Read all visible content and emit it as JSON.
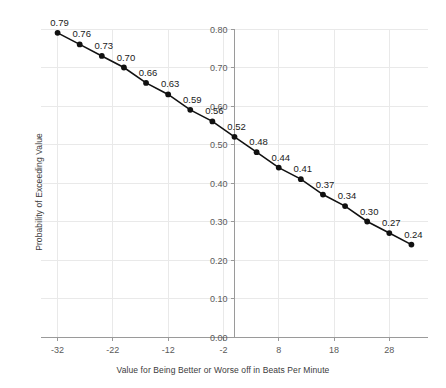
{
  "chart_data": {
    "type": "line",
    "title": "",
    "xlabel": "Value for Being Better or Worse off in Beats Per Minute",
    "ylabel": "Probability of Exceeding Value",
    "x": [
      -32,
      -28,
      -24,
      -20,
      -16,
      -12,
      -8,
      -4,
      0,
      4,
      8,
      12,
      16,
      20,
      24,
      28,
      32
    ],
    "values": [
      0.79,
      0.76,
      0.73,
      0.7,
      0.66,
      0.63,
      0.59,
      0.56,
      0.52,
      0.48,
      0.44,
      0.41,
      0.37,
      0.34,
      0.3,
      0.27,
      0.24
    ],
    "point_labels": [
      "0.79",
      "0.76",
      "0.73",
      "0.70",
      "0.66",
      "0.63",
      "0.59",
      "0.56",
      "0.52",
      "0.48",
      "0.44",
      "0.41",
      "0.37",
      "0.34",
      "0.30",
      "0.27",
      "0.24"
    ],
    "xlim": [
      -35,
      35
    ],
    "ylim": [
      0.0,
      0.8
    ],
    "xticks": [
      -32,
      -22,
      -12,
      -2,
      8,
      18,
      28
    ],
    "xtick_labels": [
      "-32",
      "-22",
      "-12",
      "-2",
      "8",
      "18",
      "28"
    ],
    "yticks": [
      0.0,
      0.1,
      0.2,
      0.3,
      0.4,
      0.5,
      0.6,
      0.7,
      0.8
    ],
    "ytick_labels": [
      "0.00",
      "0.10",
      "0.20",
      "0.30",
      "0.40",
      "0.50",
      "0.60",
      "0.70",
      "0.80"
    ],
    "grid": true,
    "legend": false,
    "series_color": "#111111",
    "grid_color": "#e9e9e9",
    "axis_color": "#9a9a9a",
    "label_color": "#5a5a5a"
  }
}
